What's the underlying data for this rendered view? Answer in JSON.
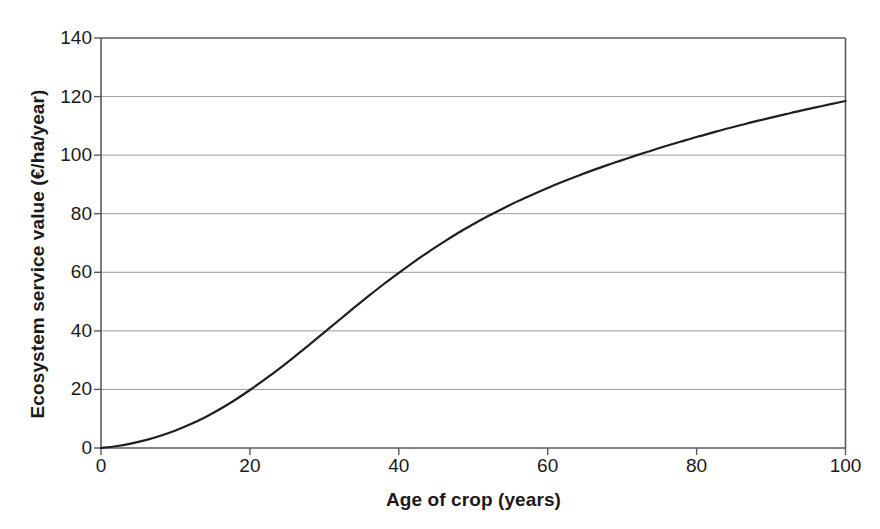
{
  "chart_data": {
    "type": "line",
    "title": "",
    "xlabel": "Age of crop (years)",
    "ylabel": "Ecosystem service value (€/ha/year)",
    "xlim": [
      0,
      100
    ],
    "ylim": [
      0,
      140
    ],
    "xticks": [
      "0",
      "20",
      "40",
      "60",
      "80",
      "100"
    ],
    "yticks": [
      "0",
      "20",
      "40",
      "60",
      "80",
      "100",
      "120",
      "140"
    ],
    "xtick_values": [
      0,
      20,
      40,
      60,
      80,
      100
    ],
    "ytick_values": [
      0,
      20,
      40,
      60,
      80,
      100,
      120,
      140
    ],
    "grid": "horizontal",
    "legend": "none",
    "series": [
      {
        "name": "Ecosystem service value",
        "color": "#1f1f1f",
        "line_width": 2.2,
        "x": [
          0,
          2,
          4,
          6,
          8,
          10,
          12,
          14,
          16,
          18,
          20,
          22,
          24,
          26,
          28,
          30,
          32,
          34,
          36,
          38,
          40,
          42,
          44,
          46,
          48,
          50,
          52,
          54,
          56,
          58,
          60,
          62,
          64,
          66,
          68,
          70,
          72,
          74,
          76,
          78,
          80,
          82,
          84,
          86,
          88,
          90,
          92,
          94,
          96,
          98,
          100
        ],
        "y": [
          0.0,
          0.6,
          1.5,
          2.7,
          4.2,
          6.0,
          8.1,
          10.5,
          13.3,
          16.4,
          19.8,
          23.4,
          27.2,
          31.2,
          35.3,
          39.5,
          43.7,
          47.9,
          52.0,
          56.0,
          59.8,
          63.5,
          67.0,
          70.3,
          73.5,
          76.4,
          79.2,
          81.8,
          84.3,
          86.6,
          88.8,
          90.9,
          92.9,
          94.8,
          96.6,
          98.3,
          100.0,
          101.6,
          103.2,
          104.7,
          106.2,
          107.6,
          109.0,
          110.3,
          111.6,
          112.8,
          114.0,
          115.2,
          116.3,
          117.4,
          118.5
        ]
      }
    ],
    "annotations": {
      "curve_shape": "logistic S-curve rising from 0 at age 0 to about 119 at age 100",
      "crossings": [
        {
          "value": 20,
          "age": 18
        },
        {
          "value": 40,
          "age": 32
        },
        {
          "value": 60,
          "age": 42
        },
        {
          "value": 80,
          "age": 56
        },
        {
          "value": 100,
          "age": 72
        }
      ]
    },
    "colors": {
      "background": "#ffffff",
      "frame": "#5a5a5a",
      "gridline": "#9a9a9a",
      "line": "#1f1f1f",
      "text": "#1a1a1a"
    }
  }
}
